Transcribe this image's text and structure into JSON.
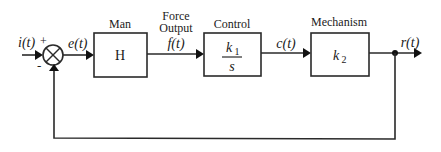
{
  "diagram": {
    "type": "feedback-control-block-diagram",
    "input_signal": "i(t)",
    "input_sign": "+",
    "feedback_sign": "-",
    "error_signal": "e(t)",
    "blocks": [
      {
        "id": "man",
        "title": "Man",
        "content": "H"
      },
      {
        "id": "control",
        "title": "Control",
        "numerator": "k",
        "numerator_sub": "1",
        "denominator": "s"
      },
      {
        "id": "mechanism",
        "title": "Mechanism",
        "content": "k",
        "content_sub": "2"
      }
    ],
    "force_label_line1": "Force",
    "force_label_line2": "Output",
    "force_signal": "f(t)",
    "control_signal": "c(t)",
    "output_signal": "r(t)",
    "colors": {
      "line": "#2a2a2a",
      "text": "#1a1a1a",
      "background": "#ffffff"
    }
  }
}
